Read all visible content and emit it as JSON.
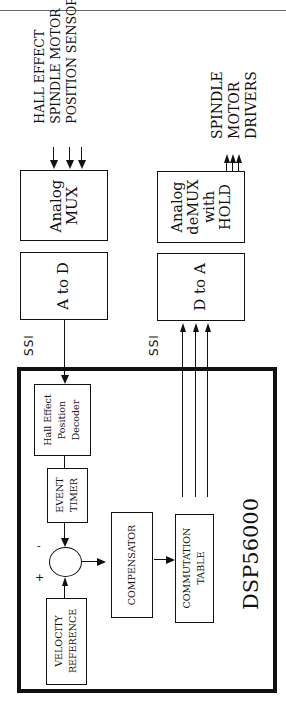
{
  "diagram": {
    "title": "DSP56000",
    "external_blocks": {
      "analog_mux": "Analog\nMUX",
      "a_to_d": "A to D",
      "analog_demux": "Analog\ndeMUX\nwith\nHOLD",
      "d_to_a": "D to A"
    },
    "inputs_label": [
      "HALL EFFECT",
      "SPINDLE MOTOR",
      "POSITION SENSOR"
    ],
    "outputs_label": [
      "SPINDLE",
      "MOTOR",
      "DRIVERS"
    ],
    "ssi_labels": [
      "SSI",
      "SSI"
    ],
    "internal_blocks": {
      "hall_decoder": [
        "Hall  Effect",
        "Position",
        "Decoder"
      ],
      "event_timer": [
        "EVENT",
        "TIMER"
      ],
      "velocity_reference": [
        "VELOCITY",
        "REFERENCE"
      ],
      "compensator": "COMPENSATOR",
      "commutation_table": [
        "COMMUTATION",
        "TABLE"
      ]
    },
    "summer_signs": {
      "minus": "-",
      "plus": "+"
    },
    "edges": [
      {
        "from": "hall_sensor",
        "to": "analog_mux",
        "count": 3
      },
      {
        "from": "analog_mux",
        "to": "a_to_d"
      },
      {
        "from": "a_to_d",
        "to": "hall_decoder",
        "via": "SSI"
      },
      {
        "from": "hall_decoder",
        "to": "event_timer"
      },
      {
        "from": "event_timer",
        "to": "summer",
        "sign": "-"
      },
      {
        "from": "velocity_reference",
        "to": "summer",
        "sign": "+"
      },
      {
        "from": "summer",
        "to": "compensator"
      },
      {
        "from": "compensator",
        "to": "commutation_table"
      },
      {
        "from": "commutation_table",
        "to": "d_to_a",
        "via": "SSI",
        "count": 3
      },
      {
        "from": "d_to_a",
        "to": "analog_demux"
      },
      {
        "from": "analog_demux",
        "to": "spindle_motor_drivers",
        "count": 3
      }
    ]
  }
}
